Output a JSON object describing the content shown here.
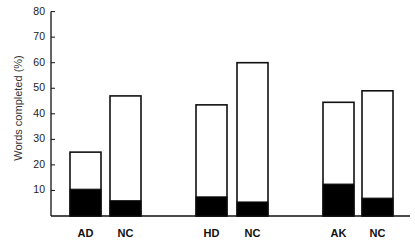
{
  "chart_data": {
    "type": "bar",
    "stacked": true,
    "title": "",
    "xlabel": "",
    "ylabel": "Words completed (%)",
    "ylim": [
      0,
      80
    ],
    "yticks": [
      10,
      20,
      30,
      40,
      50,
      60,
      70,
      80
    ],
    "grid": false,
    "legend": null,
    "categories": [
      "AD",
      "NC",
      "HD",
      "NC",
      "AK",
      "NC"
    ],
    "groups": [
      [
        "AD",
        "NC"
      ],
      [
        "HD",
        "NC"
      ],
      [
        "AK",
        "NC"
      ]
    ],
    "series": [
      {
        "name": "black (lower) portion",
        "color": "#000000",
        "values": [
          10.5,
          6,
          7.5,
          5.5,
          12.5,
          7
        ]
      },
      {
        "name": "total",
        "color": "#ffffff",
        "values": [
          25,
          47,
          43.5,
          60,
          44.5,
          49
        ]
      }
    ]
  },
  "axis": {
    "ylabel": "Words completed (%)",
    "yticks": [
      "10",
      "20",
      "30",
      "40",
      "50",
      "60",
      "70",
      "80"
    ],
    "xticks": [
      "AD",
      "NC",
      "HD",
      "NC",
      "AK",
      "NC"
    ]
  }
}
